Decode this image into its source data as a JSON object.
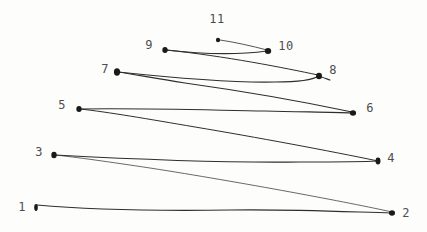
{
  "drawing": {
    "background": "#fdfdfc",
    "line_color": "#2e2e2e",
    "dot_color": "#1a1a1a",
    "label_color": "#4d4d4d",
    "points": [
      {
        "label": "1",
        "dot": {
          "x": 36,
          "y": 207.5,
          "rx": 1.8,
          "ry": 3.4
        },
        "label_pos": {
          "x": 22,
          "y": 207
        }
      },
      {
        "label": "2",
        "dot": {
          "x": 392,
          "y": 213,
          "rx": 3.0,
          "ry": 2.7
        },
        "label_pos": {
          "x": 406,
          "y": 213
        }
      },
      {
        "label": "3",
        "dot": {
          "x": 54,
          "y": 155,
          "rx": 2.7,
          "ry": 3.2
        },
        "label_pos": {
          "x": 39,
          "y": 152
        }
      },
      {
        "label": "4",
        "dot": {
          "x": 378,
          "y": 161,
          "rx": 2.5,
          "ry": 3.4
        },
        "label_pos": {
          "x": 391,
          "y": 158
        }
      },
      {
        "label": "5",
        "dot": {
          "x": 79,
          "y": 109,
          "rx": 2.7,
          "ry": 2.9
        },
        "label_pos": {
          "x": 62,
          "y": 105
        }
      },
      {
        "label": "6",
        "dot": {
          "x": 353,
          "y": 113,
          "rx": 3.1,
          "ry": 2.8
        },
        "label_pos": {
          "x": 370,
          "y": 108
        }
      },
      {
        "label": "7",
        "dot": {
          "x": 117,
          "y": 72,
          "rx": 3.1,
          "ry": 3.7
        },
        "label_pos": {
          "x": 105,
          "y": 69
        }
      },
      {
        "label": "8",
        "dot": {
          "x": 319,
          "y": 76,
          "rx": 3.0,
          "ry": 3.3
        },
        "label_pos": {
          "x": 333,
          "y": 70
        }
      },
      {
        "label": "9",
        "dot": {
          "x": 165,
          "y": 50,
          "rx": 2.7,
          "ry": 2.9
        },
        "label_pos": {
          "x": 149,
          "y": 45
        }
      },
      {
        "label": "10",
        "dot": {
          "x": 268,
          "y": 51,
          "rx": 3.2,
          "ry": 2.9
        },
        "label_pos": {
          "x": 286,
          "y": 46
        }
      },
      {
        "label": "11",
        "dot": {
          "x": 218,
          "y": 40,
          "rx": 2.1,
          "ry": 2.3
        },
        "label_pos": {
          "x": 217,
          "y": 19
        }
      }
    ],
    "segments": [
      {
        "from": "1",
        "to": "2",
        "path": "M 37 205 C 80 209, 150 211, 230 210 C 290 209, 352 212, 391 213",
        "width": 1.2,
        "opacity": 1
      },
      {
        "from": "2",
        "to": "3",
        "path": "M 392 212 C 352 203, 240 182, 150 168 C 110 162, 75 157, 55 155",
        "width": 0.9,
        "opacity": 0.8
      },
      {
        "from": "3",
        "to": "4",
        "path": "M 55 155 C 130 159, 230 163, 300 162 C 335 162, 362 162, 377 161",
        "width": 1.1,
        "opacity": 1
      },
      {
        "from": "4",
        "to": "5",
        "path": "M 378 161 C 330 151, 255 137, 195 127 C 148 119, 108 112, 80 109",
        "width": 1.0,
        "opacity": 1
      },
      {
        "from": "5",
        "to": "6",
        "path": "M 80 109 C 140 108, 205 110, 265 111 C 300 112, 332 112, 352 113",
        "width": 1.1,
        "opacity": 1
      },
      {
        "from": "6",
        "to": "7",
        "path": "M 352 112 C 300 101, 235 90, 185 83 C 153 78, 132 74, 118 72",
        "width": 1.1,
        "opacity": 1
      },
      {
        "from": "7",
        "to": "8",
        "path": "M 118 72 C 175 78, 235 83, 275 82 C 298 82, 313 80, 318 76 C 322 77, 327 79, 330 80",
        "width": 1.1,
        "opacity": 1
      },
      {
        "from": "8",
        "to": "9",
        "path": "M 318 75 C 285 68, 225 56, 166 50",
        "width": 1.0,
        "opacity": 1
      },
      {
        "from": "9",
        "to": "10",
        "path": "M 166 50 C 200 54, 238 55, 267 51",
        "width": 1.2,
        "opacity": 1
      },
      {
        "from": "10",
        "to": "11",
        "path": "M 267 50 C 252 46, 234 42, 220 40",
        "width": 0.9,
        "opacity": 0.9
      }
    ]
  }
}
